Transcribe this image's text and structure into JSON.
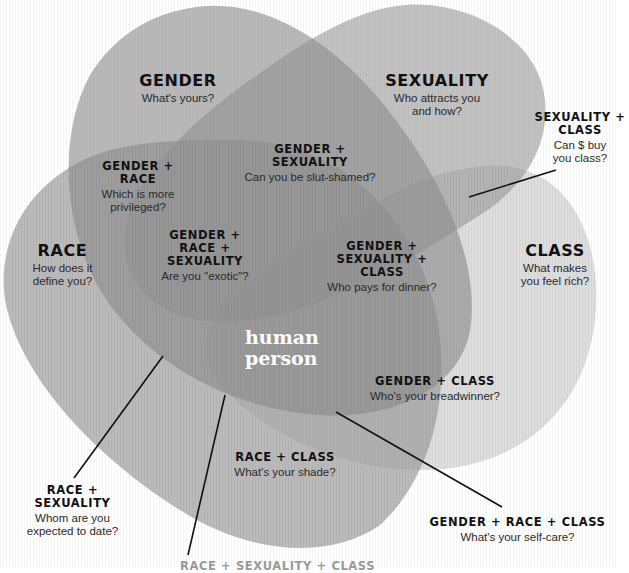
{
  "colors": {
    "background": "#ffffff",
    "gender_fill": "#9a9a9a",
    "sexuality_fill": "#a4a4a4",
    "race_fill": "#a8a8a8",
    "class_fill": "#d6d6d6",
    "leader_line": "#111111",
    "center_text": "#ffffff"
  },
  "center": {
    "line1": "human",
    "line2": "person"
  },
  "sets": {
    "gender": {
      "title": "GENDER",
      "question": "What's yours?"
    },
    "sexuality": {
      "title": "SEXUALITY",
      "question_line1": "Who attracts you",
      "question_line2": "and how?"
    },
    "race": {
      "title": "RACE",
      "question_line1": "How does it",
      "question_line2": "define you?"
    },
    "class": {
      "title": "CLASS",
      "question_line1": "What makes",
      "question_line2": "you feel rich?"
    }
  },
  "intersections": {
    "gender_race": {
      "title_line1": "GENDER +",
      "title_line2": "RACE",
      "question_line1": "Which is more",
      "question_line2": "privileged?"
    },
    "gender_sexuality": {
      "title_line1": "GENDER +",
      "title_line2": "SEXUALITY",
      "question": "Can you be slut-shamed?"
    },
    "gender_race_sexuality": {
      "title_line1": "GENDER +",
      "title_line2": "RACE +",
      "title_line3": "SEXUALITY",
      "question": "Are you \"exotic\"?"
    },
    "gender_sexuality_class": {
      "title_line1": "GENDER +",
      "title_line2": "SEXUALITY +",
      "title_line3": "CLASS",
      "question": "Who pays for dinner?"
    },
    "sexuality_class": {
      "title_line1": "SEXUALITY +",
      "title_line2": "CLASS",
      "question_line1": "Can $ buy",
      "question_line2": "you class?"
    },
    "gender_class": {
      "title": "GENDER + CLASS",
      "question": "Who's your breadwinner?"
    },
    "race_class": {
      "title": "RACE + CLASS",
      "question": "What's your shade?"
    },
    "race_sexuality": {
      "title_line1": "RACE +",
      "title_line2": "SEXUALITY",
      "question_line1": "Whom are you",
      "question_line2": "expected to date?"
    },
    "gender_race_class": {
      "title": "GENDER + RACE + CLASS",
      "question": "What's your self-care?"
    },
    "race_sexuality_class": {
      "title": "RACE + SEXUALITY + CLASS"
    }
  }
}
